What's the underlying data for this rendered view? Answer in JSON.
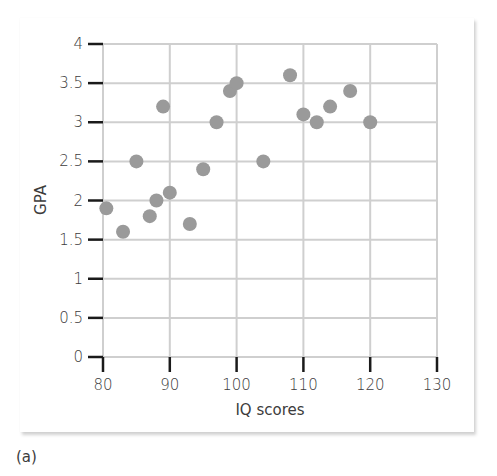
{
  "chart_data": {
    "type": "scatter",
    "title": "",
    "xlabel": "IQ scores",
    "ylabel": "GPA",
    "xlim": [
      80,
      130
    ],
    "ylim": [
      0,
      4
    ],
    "x_ticks": [
      80,
      90,
      100,
      110,
      120,
      130
    ],
    "x_tick_labels": [
      "80",
      "90",
      "100",
      "110",
      "120",
      "130"
    ],
    "y_ticks": [
      0,
      0.5,
      1,
      1.5,
      2,
      2.5,
      3,
      3.5,
      4
    ],
    "y_tick_labels": [
      "0",
      "0.5",
      "1",
      "1.5",
      "2",
      "2.5",
      "3",
      "3.5",
      "4"
    ],
    "grid": true,
    "legend": null,
    "series": [
      {
        "name": "students",
        "color": "#9a9a9a",
        "points": [
          {
            "x": 80.5,
            "y": 1.9
          },
          {
            "x": 83,
            "y": 1.6
          },
          {
            "x": 85,
            "y": 2.5
          },
          {
            "x": 87,
            "y": 1.8
          },
          {
            "x": 88,
            "y": 2.0
          },
          {
            "x": 89,
            "y": 3.2
          },
          {
            "x": 90,
            "y": 2.1
          },
          {
            "x": 93,
            "y": 1.7
          },
          {
            "x": 95,
            "y": 2.4
          },
          {
            "x": 97,
            "y": 3.0
          },
          {
            "x": 99,
            "y": 3.4
          },
          {
            "x": 100,
            "y": 3.5
          },
          {
            "x": 104,
            "y": 2.5
          },
          {
            "x": 108,
            "y": 3.6
          },
          {
            "x": 110,
            "y": 3.1
          },
          {
            "x": 112,
            "y": 3.0
          },
          {
            "x": 114,
            "y": 3.2
          },
          {
            "x": 117,
            "y": 3.4
          },
          {
            "x": 120,
            "y": 3.0
          }
        ]
      }
    ]
  },
  "panel_label": "(a)",
  "colors": {
    "grid": "#cfcfcf",
    "tick": "#1a1a1a",
    "marker": "#9a9a9a",
    "text": "#3c3c3c"
  }
}
